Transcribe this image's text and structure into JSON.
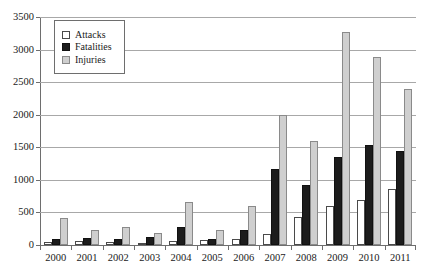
{
  "chart_data": {
    "type": "bar",
    "title": "",
    "subtitle": "",
    "xlabel": "",
    "ylabel": "",
    "ylim": [
      0,
      3500
    ],
    "ytick_step": 500,
    "yticks": [
      0,
      500,
      1000,
      1500,
      2000,
      2500,
      3000,
      3500
    ],
    "ytick_labels": [
      "0",
      "500",
      "1000",
      "1500",
      "2000",
      "2500",
      "3000",
      "3500"
    ],
    "grid": true,
    "grid_axis": "y",
    "legend_position": "top-left",
    "categories": [
      "2000",
      "2001",
      "2002",
      "2003",
      "2004",
      "2005",
      "2006",
      "2007",
      "2008",
      "2009",
      "2010",
      "2011"
    ],
    "series": [
      {
        "name": "Attacks",
        "color": "#ffffff",
        "edge_color": "#4a4a4a",
        "values": [
          45,
          55,
          45,
          30,
          65,
          70,
          100,
          175,
          435,
          600,
          690,
          865
        ]
      },
      {
        "name": "Fatalities",
        "color": "#1c1c1c",
        "edge_color": "#111111",
        "values": [
          100,
          110,
          90,
          130,
          270,
          90,
          235,
          1160,
          920,
          1355,
          1530,
          1440
        ]
      },
      {
        "name": "Injuries",
        "color": "#cfcfcf",
        "edge_color": "#8a8a8a",
        "values": [
          415,
          235,
          275,
          180,
          660,
          230,
          600,
          2000,
          1590,
          3270,
          2880,
          2390
        ]
      }
    ]
  },
  "legend": {
    "items": [
      {
        "label": "Attacks",
        "swatch": "attacks-swatch"
      },
      {
        "label": "Fatalities",
        "swatch": "fatalities-swatch"
      },
      {
        "label": "Injuries",
        "swatch": "injuries-swatch"
      }
    ]
  }
}
